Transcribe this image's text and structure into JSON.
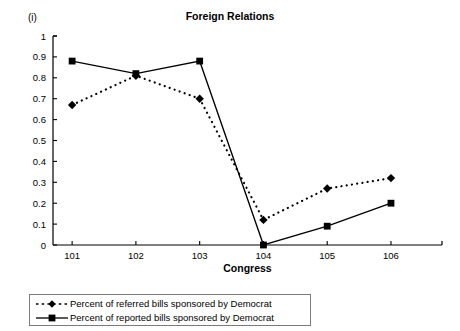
{
  "panel": {
    "label": "(i)"
  },
  "chart_data": {
    "type": "line",
    "title": "Foreign Relations",
    "xlabel": "Congress",
    "ylabel": "",
    "categories": [
      "101",
      "102",
      "103",
      "104",
      "105",
      "106"
    ],
    "x": [
      101,
      102,
      103,
      104,
      105,
      106
    ],
    "xlim": [
      100.7,
      106.8
    ],
    "ylim": [
      0,
      1
    ],
    "yticks": [
      "0",
      "0.1",
      "0.2",
      "0.3",
      "0.4",
      "0.5",
      "0.6",
      "0.7",
      "0.8",
      "0.9",
      "1"
    ],
    "ytick_values": [
      0,
      0.1,
      0.2,
      0.3,
      0.4,
      0.5,
      0.6,
      0.7,
      0.8,
      0.9,
      1
    ],
    "grid": false,
    "legend_position": "bottom-left",
    "series": [
      {
        "name": "Percent of referred bills sponsored by Democrat",
        "values": [
          0.67,
          0.81,
          0.7,
          0.12,
          0.27,
          0.32
        ],
        "marker": "diamond",
        "linestyle": "dotted",
        "color": "#000000"
      },
      {
        "name": "Percent of reported bills sponsored by Democrat",
        "values": [
          0.88,
          0.82,
          0.88,
          0.0,
          0.09,
          0.2
        ],
        "marker": "square",
        "linestyle": "solid",
        "color": "#000000"
      }
    ]
  },
  "legend": {
    "items": [
      {
        "label": "Percent of referred bills sponsored by Democrat",
        "style": "dotted-diamond"
      },
      {
        "label": "Percent of reported bills sponsored by Democrat",
        "style": "solid-square"
      }
    ]
  },
  "colors": {
    "axis": "#000000",
    "series": "#000000",
    "legend_border": "#7a7a7a",
    "background": "#ffffff"
  }
}
